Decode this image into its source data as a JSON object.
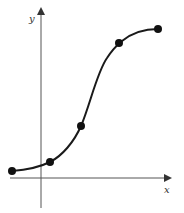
{
  "diagram": {
    "title": "",
    "type": "sigmoid-curve",
    "axes": {
      "x_label": "x",
      "y_label": "y"
    },
    "points": [
      {
        "x": 12,
        "y": 171
      },
      {
        "x": 50,
        "y": 162
      },
      {
        "x": 81,
        "y": 126
      },
      {
        "x": 119,
        "y": 43
      },
      {
        "x": 158,
        "y": 29
      }
    ],
    "colors": {
      "curve": "#1a1a1a",
      "axis": "#444444",
      "point": "#111111"
    }
  }
}
